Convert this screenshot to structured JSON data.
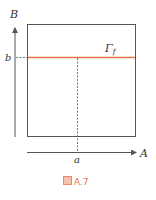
{
  "diagram": {
    "axis_vertical_label": "B",
    "axis_horizontal_label": "A",
    "b_label": "b",
    "a_label": "a",
    "curve_label": "Γ",
    "curve_label_sub": "f",
    "caption_icon": "図",
    "caption_text": "A.7",
    "colors": {
      "line": "#555555",
      "accent": "#e8734a"
    }
  }
}
